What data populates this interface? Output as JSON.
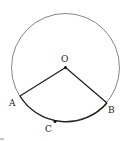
{
  "diagram": {
    "title": "",
    "circle": {
      "center": "O",
      "cx": 65.5,
      "cy": 67.5,
      "r": 54
    },
    "points": {
      "O": {
        "label": "O",
        "x": 65.5,
        "y": 67.5
      },
      "A": {
        "label": "A",
        "x": 20,
        "y": 96
      },
      "B": {
        "label": "B",
        "x": 107,
        "y": 103
      },
      "C": {
        "label": "C",
        "x": 55,
        "y": 121.5
      }
    },
    "segments": [
      "OA",
      "OB"
    ],
    "highlighted_arc": "ACB",
    "colors": {
      "stroke": "#222222",
      "circle": "#555555"
    }
  }
}
